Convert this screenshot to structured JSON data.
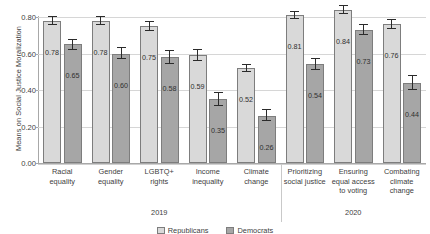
{
  "chart_data": {
    "type": "bar",
    "title": "",
    "xlabel": "",
    "ylabel": "Means on Social Justice Moralization",
    "ylim": [
      0.0,
      0.8
    ],
    "ytick_labels": [
      "0.00",
      "0.20",
      "0.40",
      "0.60",
      "0.80"
    ],
    "ytick_values": [
      0.0,
      0.2,
      0.4,
      0.6,
      0.8
    ],
    "grid": "horizontal",
    "legend_position": "bottom",
    "categories": [
      "Racial equality",
      "Gender equality",
      "LGBTQ+ rights",
      "Income inequality",
      "Climate change",
      "Prioritizing social justice",
      "Ensuring equal access to voting",
      "Combating climate change"
    ],
    "category_lines": [
      [
        "Racial",
        "equality"
      ],
      [
        "Gender",
        "equality"
      ],
      [
        "LGBTQ+",
        "rights"
      ],
      [
        "Income",
        "inequality"
      ],
      [
        "Climate",
        "change"
      ],
      [
        "Prioritizing",
        "social justice"
      ],
      [
        "Ensuring",
        "equal access",
        "to voting"
      ],
      [
        "Combating",
        "climate",
        "change"
      ]
    ],
    "groups": [
      {
        "label": "2019",
        "category_start": 0,
        "category_end": 4
      },
      {
        "label": "2020",
        "category_start": 5,
        "category_end": 7
      }
    ],
    "series": [
      {
        "name": "Series 1",
        "color": "#d9d9d9",
        "values": [
          0.78,
          0.78,
          0.75,
          0.59,
          0.52,
          0.81,
          0.84,
          0.76
        ],
        "value_labels": [
          "0.78",
          "0.78",
          "0.75",
          "0.59",
          "0.52",
          "0.81",
          "0.84",
          "0.76"
        ],
        "err_low": [
          0.755,
          0.755,
          0.723,
          0.56,
          0.498,
          0.788,
          0.814,
          0.735
        ],
        "err_high": [
          0.805,
          0.805,
          0.778,
          0.622,
          0.545,
          0.833,
          0.866,
          0.788
        ]
      },
      {
        "name": "Series 2",
        "color": "#a6a6a6",
        "values": [
          0.65,
          0.6,
          0.58,
          0.35,
          0.26,
          0.54,
          0.73,
          0.44
        ],
        "value_labels": [
          "0.65",
          "0.60",
          "0.58",
          "0.35",
          "0.26",
          "0.54",
          "0.73",
          "0.44"
        ],
        "err_low": [
          0.62,
          0.57,
          0.541,
          0.315,
          0.228,
          0.508,
          0.7,
          0.402
        ],
        "err_high": [
          0.682,
          0.633,
          0.62,
          0.39,
          0.295,
          0.575,
          0.76,
          0.482
        ]
      }
    ]
  },
  "legend": {
    "items": [
      {
        "label": "Republicans",
        "swatch": "light"
      },
      {
        "label": "Democrats",
        "swatch": "dark"
      }
    ]
  }
}
